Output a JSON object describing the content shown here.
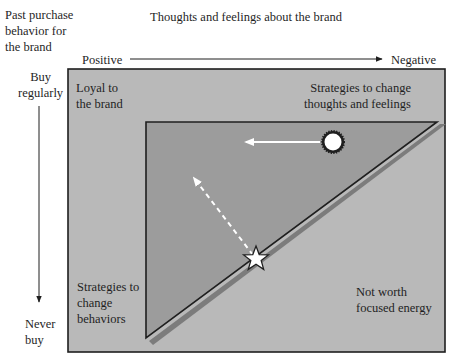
{
  "diagram": {
    "y_axis_title": "Past purchase\nbehavior for\nthe brand",
    "x_axis_title": "Thoughts and feelings about the brand",
    "x_axis": {
      "left_label": "Positive",
      "right_label": "Negative"
    },
    "y_axis": {
      "top_label": "Buy\nregularly",
      "bottom_label": "Never\nbuy"
    },
    "quadrants": {
      "top_left": "Loyal to\nthe brand",
      "top_right": "Strategies to change\nthoughts and feelings",
      "bottom_left": "Strategies to\nchange\nbehaviors",
      "bottom_right": "Not worth\nfocused energy"
    },
    "markers": [
      {
        "name": "sun-marker",
        "shape": "circle-starburst",
        "color": "#ffffff"
      },
      {
        "name": "star-marker",
        "shape": "star",
        "color": "#ffffff"
      }
    ],
    "arrows": [
      {
        "name": "solid-arrow",
        "from": "sun-marker",
        "direction": "left",
        "style": "solid",
        "color": "#ffffff"
      },
      {
        "name": "dashed-arrow",
        "from": "star-marker",
        "direction": "up-left",
        "style": "dashed",
        "color": "#ffffff"
      }
    ],
    "colors": {
      "outer_box": "#b9b9b9",
      "triangle": "#9c9c9c",
      "triangle_shadow": "#7c7c7c",
      "border": "#1f1f1f",
      "text": "#1f1f1f"
    }
  }
}
